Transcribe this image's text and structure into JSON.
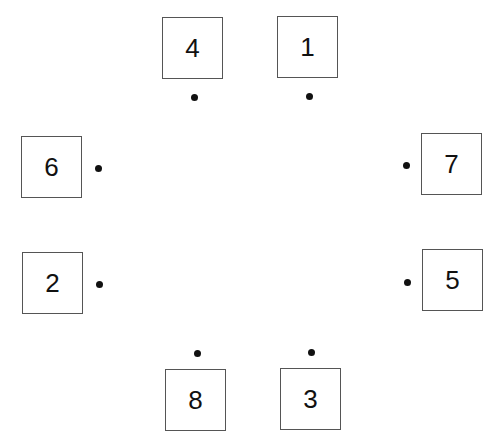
{
  "diagram": {
    "boxes": [
      {
        "label": "4",
        "x": 162,
        "y": 17,
        "dot": {
          "x": 194,
          "y": 97
        }
      },
      {
        "label": "1",
        "x": 277,
        "y": 16,
        "dot": {
          "x": 309,
          "y": 96
        }
      },
      {
        "label": "6",
        "x": 21,
        "y": 136,
        "dot": {
          "x": 98,
          "y": 168
        }
      },
      {
        "label": "7",
        "x": 421,
        "y": 133,
        "dot": {
          "x": 406,
          "y": 165
        }
      },
      {
        "label": "2",
        "x": 22,
        "y": 252,
        "dot": {
          "x": 99,
          "y": 284
        }
      },
      {
        "label": "5",
        "x": 422,
        "y": 249,
        "dot": {
          "x": 407,
          "y": 282
        }
      },
      {
        "label": "8",
        "x": 165,
        "y": 369,
        "dot": {
          "x": 197,
          "y": 353
        }
      },
      {
        "label": "3",
        "x": 280,
        "y": 368,
        "dot": {
          "x": 311,
          "y": 352
        }
      }
    ]
  }
}
